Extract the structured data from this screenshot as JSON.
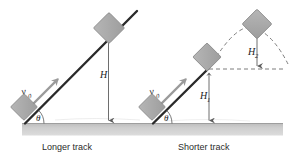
{
  "figure": {
    "title": "",
    "background_color": "#ffffff",
    "width": 305,
    "height": 160
  },
  "colors": {
    "block_fill": "#a9a9a9",
    "block_stroke": "#8a8a8a",
    "ground_fill": "#c9c9c9",
    "ground_edge": "#9e9e9e",
    "incline_stroke": "#2a2a2a",
    "velocity_arrow": "#9a9a9a",
    "height_arrow": "#6e6e6e",
    "dashed_line": "#6e6e6e",
    "label_text": "#2b2b2b"
  },
  "panels": [
    {
      "id": "longer-track",
      "caption": "Longer track",
      "angle_label": "θ",
      "velocity_label": "v",
      "velocity_subscript": "0",
      "heights": [
        {
          "id": "H",
          "label": "H",
          "subscript": ""
        }
      ],
      "blocks": [
        {
          "id": "block-bottom",
          "position": "base-of-incline",
          "rotation_deg": 36
        },
        {
          "id": "block-top",
          "position": "top-of-incline",
          "rotation_deg": 36
        }
      ],
      "has_dashed_trajectory": false
    },
    {
      "id": "shorter-track",
      "caption": "Shorter track",
      "angle_label": "θ",
      "velocity_label": "v",
      "velocity_subscript": "0",
      "heights": [
        {
          "id": "H1",
          "label": "H",
          "subscript": "1"
        },
        {
          "id": "H2",
          "label": "H",
          "subscript": "2"
        }
      ],
      "blocks": [
        {
          "id": "block-bottom",
          "position": "base-of-incline",
          "rotation_deg": 36
        },
        {
          "id": "block-launch",
          "position": "end-of-incline",
          "rotation_deg": 36
        },
        {
          "id": "block-apex",
          "position": "apex-of-trajectory",
          "rotation_deg": 45
        }
      ],
      "has_dashed_trajectory": true
    }
  ]
}
